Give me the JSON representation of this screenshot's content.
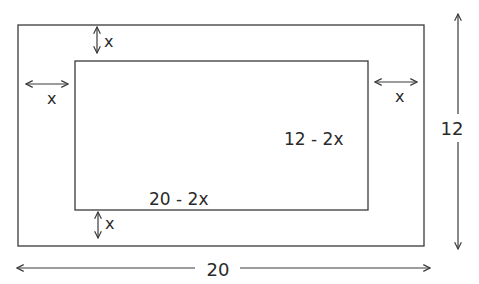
{
  "diagram": {
    "type": "dimensioned-rectangles",
    "outer_rect": {
      "width_label": "20",
      "height_label": "12"
    },
    "inner_rect": {
      "width_label": "20 - 2x",
      "height_label": "12 - 2x"
    },
    "margins": {
      "top": "x",
      "bottom": "x",
      "left": "x",
      "right": "x"
    },
    "colors": {
      "stroke": "#3a3a3a",
      "text": "#2a2a2a",
      "background": "#ffffff"
    }
  }
}
